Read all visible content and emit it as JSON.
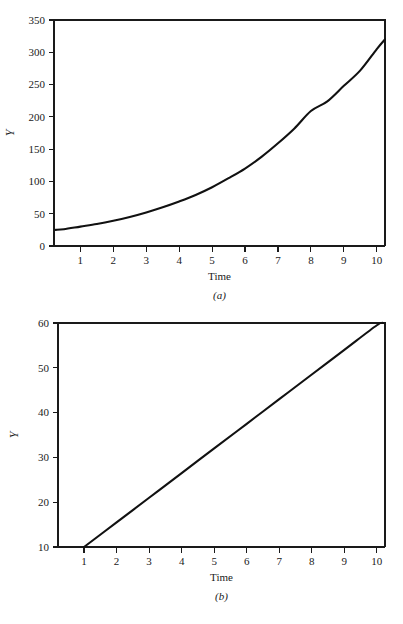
{
  "figure": {
    "background_color": "#ffffff",
    "line_color": "#111111",
    "text_color": "#1a1a1a"
  },
  "panel_a": {
    "caption": "(a)",
    "xlabel": "Time",
    "ylabel": "Y",
    "y_ticks": [
      "0",
      "50",
      "100",
      "150",
      "200",
      "250",
      "300",
      "350"
    ],
    "x_ticks": [
      "1",
      "2",
      "3",
      "4",
      "5",
      "6",
      "7",
      "8",
      "9",
      "10"
    ]
  },
  "panel_b": {
    "caption": "(b)",
    "xlabel": "Time",
    "ylabel": "Y",
    "y_ticks": [
      "10",
      "20",
      "30",
      "40",
      "50",
      "60"
    ],
    "x_ticks": [
      "1",
      "2",
      "3",
      "4",
      "5",
      "6",
      "7",
      "8",
      "9",
      "10"
    ]
  },
  "chart_data": [
    {
      "type": "line",
      "id": "panel-a",
      "title": "",
      "subtitle": "",
      "caption": "(a)",
      "xlabel": "Time",
      "ylabel": "Y",
      "xlim": [
        0.2,
        10.25
      ],
      "ylim": [
        0,
        350
      ],
      "xticks": [
        1,
        2,
        3,
        4,
        5,
        6,
        7,
        8,
        9,
        10
      ],
      "yticks": [
        0,
        50,
        100,
        150,
        200,
        250,
        300,
        350
      ],
      "grid": false,
      "legend": null,
      "description": "Exponential growth curve rising from about 25 to about 320",
      "series": [
        {
          "name": "Y",
          "color": "#111111",
          "x": [
            0.25,
            0.5,
            1,
            1.5,
            2,
            2.5,
            3,
            3.5,
            4,
            4.5,
            5,
            5.5,
            6,
            6.5,
            7,
            7.5,
            8,
            8.5,
            9,
            9.5,
            10,
            10.25
          ],
          "values": [
            25,
            26,
            30,
            34,
            39,
            45,
            52,
            60,
            69,
            79,
            91,
            105,
            120,
            138,
            159,
            182,
            209,
            224,
            248,
            272,
            305,
            320
          ]
        }
      ]
    },
    {
      "type": "line",
      "id": "panel-b",
      "title": "",
      "subtitle": "",
      "caption": "(b)",
      "xlabel": "Time",
      "ylabel": "Y",
      "xlim": [
        0.2,
        10.25
      ],
      "ylim": [
        10,
        60
      ],
      "xticks": [
        1,
        2,
        3,
        4,
        5,
        6,
        7,
        8,
        9,
        10
      ],
      "yticks": [
        10,
        20,
        30,
        40,
        50,
        60
      ],
      "grid": false,
      "legend": null,
      "description": "Straight line rising linearly from (1, 10) to (10.2, 60)",
      "series": [
        {
          "name": "Y",
          "color": "#111111",
          "x": [
            1,
            2,
            3,
            4,
            5,
            6,
            7,
            8,
            9,
            10,
            10.2
          ],
          "values": [
            10,
            15.5,
            21,
            26.5,
            32,
            37.5,
            43,
            48.5,
            54,
            59.5,
            60
          ]
        }
      ]
    }
  ]
}
